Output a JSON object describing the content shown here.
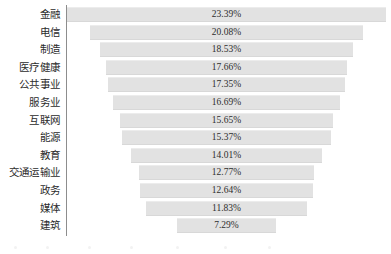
{
  "chart_data": {
    "type": "bar",
    "subtype": "funnel",
    "title": "",
    "subtitle": "",
    "xlabel": "",
    "ylabel": "",
    "grid": false,
    "legend": null,
    "orientation": "horizontal-centered",
    "axis_line": "left-vertical",
    "value_suffix": "%",
    "xlim": [
      0,
      23.39
    ],
    "categories": [
      "金融",
      "电信",
      "制造",
      "医疗健康",
      "公共事业",
      "服务业",
      "互联网",
      "能源",
      "教育",
      "交通运输业",
      "政务",
      "媒体",
      "建筑"
    ],
    "values": [
      23.39,
      20.08,
      18.53,
      17.66,
      17.35,
      16.69,
      15.65,
      15.37,
      14.01,
      12.77,
      12.64,
      11.83,
      7.29
    ],
    "labels": [
      "23.39%",
      "20.08%",
      "18.53%",
      "17.66%",
      "17.35%",
      "16.69%",
      "15.65%",
      "15.37%",
      "14.01%",
      "12.77%",
      "12.64%",
      "11.83%",
      "7.29%"
    ],
    "colors": {
      "bar_fill": "#e2e2e2",
      "bar_top_edge": "#ececec",
      "bar_bottom_edge": "#d8d8d8",
      "axis": "#8d8d8d",
      "label_text": "#2b2b2b",
      "value_text": "#2e2e2e",
      "background": "#ffffff"
    }
  },
  "rows": [
    {
      "label": "金融",
      "value": "23.39%"
    },
    {
      "label": "电信",
      "value": "20.08%"
    },
    {
      "label": "制造",
      "value": "18.53%"
    },
    {
      "label": "医疗健康",
      "value": "17.66%"
    },
    {
      "label": "公共事业",
      "value": "17.35%"
    },
    {
      "label": "服务业",
      "value": "16.69%"
    },
    {
      "label": "互联网",
      "value": "15.65%"
    },
    {
      "label": "能源",
      "value": "15.37%"
    },
    {
      "label": "教育",
      "value": "14.01%"
    },
    {
      "label": "交通运输业",
      "value": "12.77%"
    },
    {
      "label": "政务",
      "value": "12.64%"
    },
    {
      "label": "媒体",
      "value": "11.83%"
    },
    {
      "label": "建筑",
      "value": "7.29%"
    }
  ]
}
